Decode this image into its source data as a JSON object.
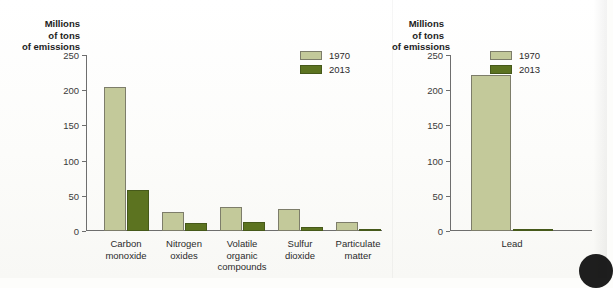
{
  "chart_data": [
    {
      "type": "bar",
      "panel": "left",
      "title": "",
      "ylabel": "Millions of tons of emissions",
      "ylabel_lines": [
        "Millions",
        "of tons",
        "of emissions"
      ],
      "xlabel": "",
      "ylim": [
        0,
        250
      ],
      "yticks": [
        0,
        50,
        100,
        150,
        200,
        250
      ],
      "ytick_labels": [
        "0",
        "50",
        "100",
        "150",
        "200",
        "250"
      ],
      "grid": false,
      "legend_position": "top-right",
      "categories": [
        "Carbon monoxide",
        "Nitrogen oxides",
        "Volatile organic compounds",
        "Sulfur dioxide",
        "Particulate matter"
      ],
      "category_lines": [
        [
          "Carbon",
          "monoxide"
        ],
        [
          "Nitrogen",
          "oxides"
        ],
        [
          "Volatile",
          "organic",
          "compounds"
        ],
        [
          "Sulfur",
          "dioxide"
        ],
        [
          "Particulate",
          "matter"
        ]
      ],
      "series": [
        {
          "name": "1970",
          "color": "#c3c99a",
          "values": [
            204,
            27,
            34,
            31,
            13
          ]
        },
        {
          "name": "2013",
          "color": "#5c7320",
          "values": [
            58,
            12,
            13,
            5,
            1
          ]
        }
      ]
    },
    {
      "type": "bar",
      "panel": "right",
      "title": "",
      "ylabel": "Millions of tons of emissions",
      "ylabel_lines": [
        "Millions",
        "of tons",
        "of emissions"
      ],
      "xlabel": "",
      "ylim": [
        0,
        250
      ],
      "yticks": [
        0,
        50,
        100,
        150,
        200,
        250
      ],
      "ytick_labels": [
        "0",
        "50",
        "100",
        "150",
        "200",
        "250"
      ],
      "grid": false,
      "legend_position": "top-right",
      "categories": [
        "Lead"
      ],
      "category_lines": [
        [
          "Lead"
        ]
      ],
      "series": [
        {
          "name": "1970",
          "color": "#c3c99a",
          "values": [
            221
          ]
        },
        {
          "name": "2013",
          "color": "#5c7320",
          "values": [
            0.5
          ]
        }
      ]
    }
  ],
  "legend": {
    "entries": [
      {
        "label": "1970",
        "color": "#c3c99a"
      },
      {
        "label": "2013",
        "color": "#5c7320"
      }
    ]
  },
  "colors": {
    "series_1970": "#c3c99a",
    "series_2013": "#5c7320",
    "axis": "#6e6e6e",
    "text": "#2b2b2b",
    "background": "#fdfdfb"
  }
}
